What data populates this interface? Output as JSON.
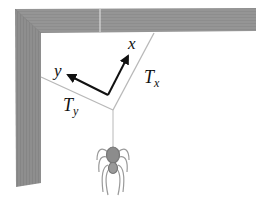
{
  "labels": {
    "x_axis": "x",
    "y_axis": "y",
    "tension_x": "T",
    "tension_x_sub": "x",
    "tension_y": "T",
    "tension_y_sub": "y"
  },
  "colors": {
    "wood": "#8a8a8a",
    "wood_dark": "#6e6e6e",
    "thread": "#b8b8b8",
    "axis": "#111111",
    "spider": "#8c8c8c"
  }
}
